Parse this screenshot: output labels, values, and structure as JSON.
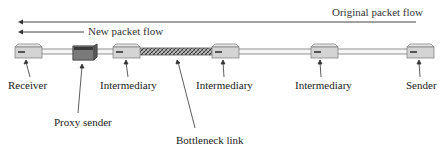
{
  "diagram": {
    "flows": {
      "original": {
        "label": "Original packet flow",
        "direction": "right-to-left"
      },
      "new": {
        "label": "New packet flow",
        "direction": "right-to-left"
      }
    },
    "nodes": [
      {
        "id": "receiver",
        "label": "Receiver",
        "type": "host"
      },
      {
        "id": "proxy",
        "label": "Proxy sender",
        "type": "proxy"
      },
      {
        "id": "intermediary1",
        "label": "Intermediary",
        "type": "host"
      },
      {
        "id": "intermediary2",
        "label": "Intermediary",
        "type": "host"
      },
      {
        "id": "intermediary3",
        "label": "Intermediary",
        "type": "host"
      },
      {
        "id": "sender",
        "label": "Sender",
        "type": "host"
      }
    ],
    "links": [
      {
        "from": "receiver",
        "to": "proxy",
        "style": "normal"
      },
      {
        "from": "proxy",
        "to": "intermediary1",
        "style": "normal"
      },
      {
        "from": "intermediary1",
        "to": "intermediary2",
        "style": "bottleneck"
      },
      {
        "from": "intermediary2",
        "to": "intermediary3",
        "style": "normal"
      },
      {
        "from": "intermediary3",
        "to": "sender",
        "style": "normal"
      }
    ],
    "bottleneck_label": "Bottleneck link"
  },
  "colors": {
    "device_fill": "#d4d4d4",
    "proxy_fill": "#6e6e6e",
    "line": "#555555"
  }
}
